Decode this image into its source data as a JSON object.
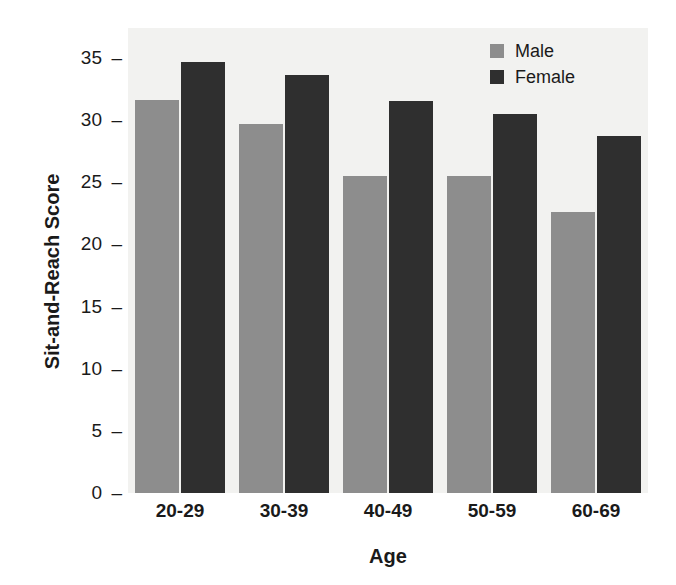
{
  "chart_data": {
    "type": "bar",
    "title": "",
    "xlabel": "Age",
    "ylabel": "Sit-and-Reach Score",
    "categories": [
      "20-29",
      "30-39",
      "40-49",
      "50-59",
      "60-69"
    ],
    "series": [
      {
        "name": "Male",
        "color": "#8d8d8d",
        "values": [
          31.6,
          29.7,
          25.5,
          25.5,
          22.6
        ]
      },
      {
        "name": "Female",
        "color": "#2f2f2f",
        "values": [
          34.7,
          33.6,
          31.5,
          30.5,
          28.7
        ]
      }
    ],
    "yticks": [
      0,
      5,
      10,
      15,
      20,
      25,
      30,
      35
    ],
    "ytick_labels": [
      "0",
      "5",
      "10",
      "15",
      "20",
      "25",
      "30",
      "35"
    ],
    "ylim": [
      0,
      37.4
    ],
    "grid": false,
    "legend_position": "top-right",
    "plot_background": "#f2f2f0",
    "figure_background": "#ffffff"
  },
  "legend": {
    "entries": [
      {
        "label": "Male"
      },
      {
        "label": "Female"
      }
    ]
  },
  "axes": {
    "x_title": "Age",
    "y_title": "Sit-and-Reach Score",
    "tick_dash": "–"
  }
}
